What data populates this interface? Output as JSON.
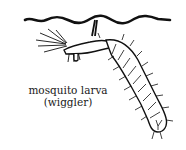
{
  "illustration": {
    "subject": "mosquito larva",
    "colors": {
      "ink": "#111111",
      "background": "#ffffff"
    }
  },
  "caption": {
    "line1": "mosquito larva",
    "line2": "(wiggler)"
  }
}
